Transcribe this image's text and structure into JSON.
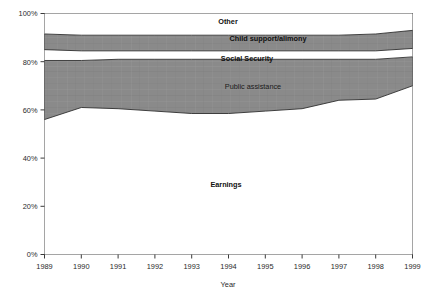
{
  "chart_data": {
    "type": "area",
    "stacked": true,
    "normalized": true,
    "title": "",
    "xlabel": "Year",
    "ylabel": "",
    "grid": false,
    "legend": "inline-labels",
    "x": [
      1989,
      1990,
      1991,
      1992,
      1993,
      1994,
      1995,
      1996,
      1997,
      1998,
      1999
    ],
    "categories": [
      "1989",
      "1990",
      "1991",
      "1992",
      "1993",
      "1994",
      "1995",
      "1996",
      "1997",
      "1998",
      "1999"
    ],
    "xtick_labels": [
      "1989",
      "1990",
      "1991",
      "1992",
      "1993",
      "1994",
      "1995",
      "1996",
      "1997",
      "1998",
      "1999"
    ],
    "ytick_labels": [
      "0%",
      "20%",
      "40%",
      "60%",
      "80%",
      "100%"
    ],
    "ytick_values": [
      0,
      20,
      40,
      60,
      80,
      100
    ],
    "ylim": [
      0,
      100
    ],
    "xlim": [
      1989,
      1999
    ],
    "series": [
      {
        "name": "Earnings",
        "fill": "white",
        "values": [
          56.0,
          61.0,
          60.5,
          59.5,
          58.5,
          58.5,
          59.5,
          60.5,
          64.0,
          64.5,
          70.0
        ]
      },
      {
        "name": "Public assistance",
        "fill": "gray",
        "values": [
          24.5,
          19.5,
          20.5,
          21.5,
          22.5,
          22.5,
          21.5,
          20.5,
          17.0,
          16.5,
          12.0
        ]
      },
      {
        "name": "Social Security",
        "fill": "white",
        "values": [
          4.5,
          4.0,
          3.5,
          3.5,
          3.5,
          3.5,
          3.5,
          3.5,
          3.5,
          3.5,
          3.5
        ]
      },
      {
        "name": "Child support/alimony",
        "fill": "gray",
        "values": [
          6.5,
          6.5,
          6.5,
          6.5,
          6.5,
          6.5,
          6.5,
          6.5,
          6.5,
          7.0,
          7.5
        ]
      },
      {
        "name": "Other",
        "fill": "white",
        "values": [
          8.5,
          9.0,
          9.0,
          9.0,
          9.0,
          9.0,
          9.0,
          9.0,
          9.0,
          8.5,
          7.0
        ]
      }
    ],
    "cumulative_tops": {
      "earnings": [
        56.0,
        61.0,
        60.5,
        59.5,
        58.5,
        58.5,
        59.5,
        60.5,
        64.0,
        64.5,
        70.0
      ],
      "public_assistance": [
        80.5,
        80.5,
        81.0,
        81.0,
        81.0,
        81.0,
        81.0,
        81.0,
        81.0,
        81.0,
        82.0
      ],
      "social_security": [
        85.0,
        84.5,
        84.5,
        84.5,
        84.5,
        84.5,
        84.5,
        84.5,
        84.5,
        84.5,
        85.5
      ],
      "child_support_alimony": [
        91.5,
        91.0,
        91.0,
        91.0,
        91.0,
        91.0,
        91.0,
        91.0,
        91.0,
        91.5,
        93.0
      ],
      "other": [
        100,
        100,
        100,
        100,
        100,
        100,
        100,
        100,
        100,
        100,
        100
      ]
    },
    "inline_labels": [
      {
        "key": "other",
        "text": "Other",
        "x": 228,
        "y": 24,
        "bold": true
      },
      {
        "key": "child-support-alimony",
        "text": "Child support/alimony",
        "x": 268,
        "y": 41,
        "bold": true
      },
      {
        "key": "social-security",
        "text": "Social Security",
        "x": 247,
        "y": 61,
        "bold": true
      },
      {
        "key": "public-assistance",
        "text": "Public assistance",
        "x": 253,
        "y": 89,
        "bold": false
      },
      {
        "key": "earnings",
        "text": "Earnings",
        "x": 226,
        "y": 187,
        "bold": true
      }
    ],
    "colors": {
      "fill_gray": "#8a8a8a",
      "fill_white": "#ffffff",
      "outline": "#2f2f2f",
      "axis": "#3a3a3a",
      "text": "#1a1a1a"
    }
  }
}
